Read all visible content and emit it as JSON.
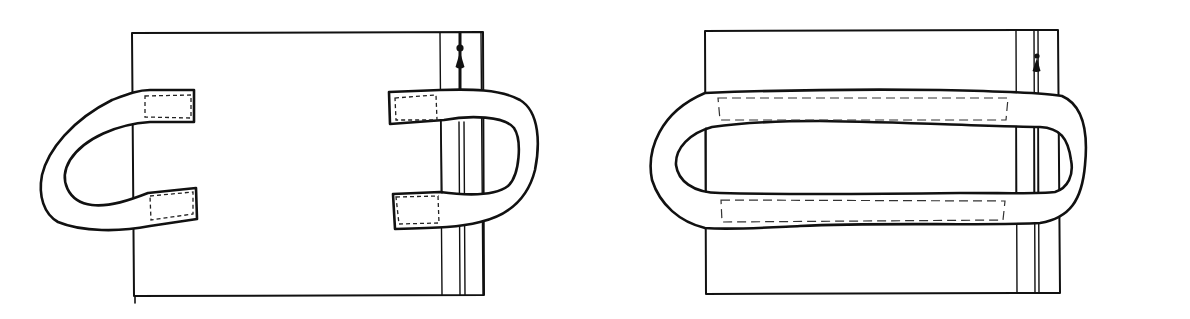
{
  "figure": {
    "type": "sewing-illustration",
    "panels": [
      {
        "id": "step-1",
        "description": "Bag panel with zipper; two strap handles, ends pinned with rectangular stitch boxes (left handle open C-shape, right handle passing over zipper)"
      },
      {
        "id": "step-2",
        "description": "Bag panel with zipper; single closed strap loop stitched along top and bottom with long dashed stitch lines"
      }
    ],
    "colors": {
      "ink": "#111111",
      "paper": "#ffffff"
    },
    "icons": [
      "zipper-pull-icon"
    ]
  }
}
